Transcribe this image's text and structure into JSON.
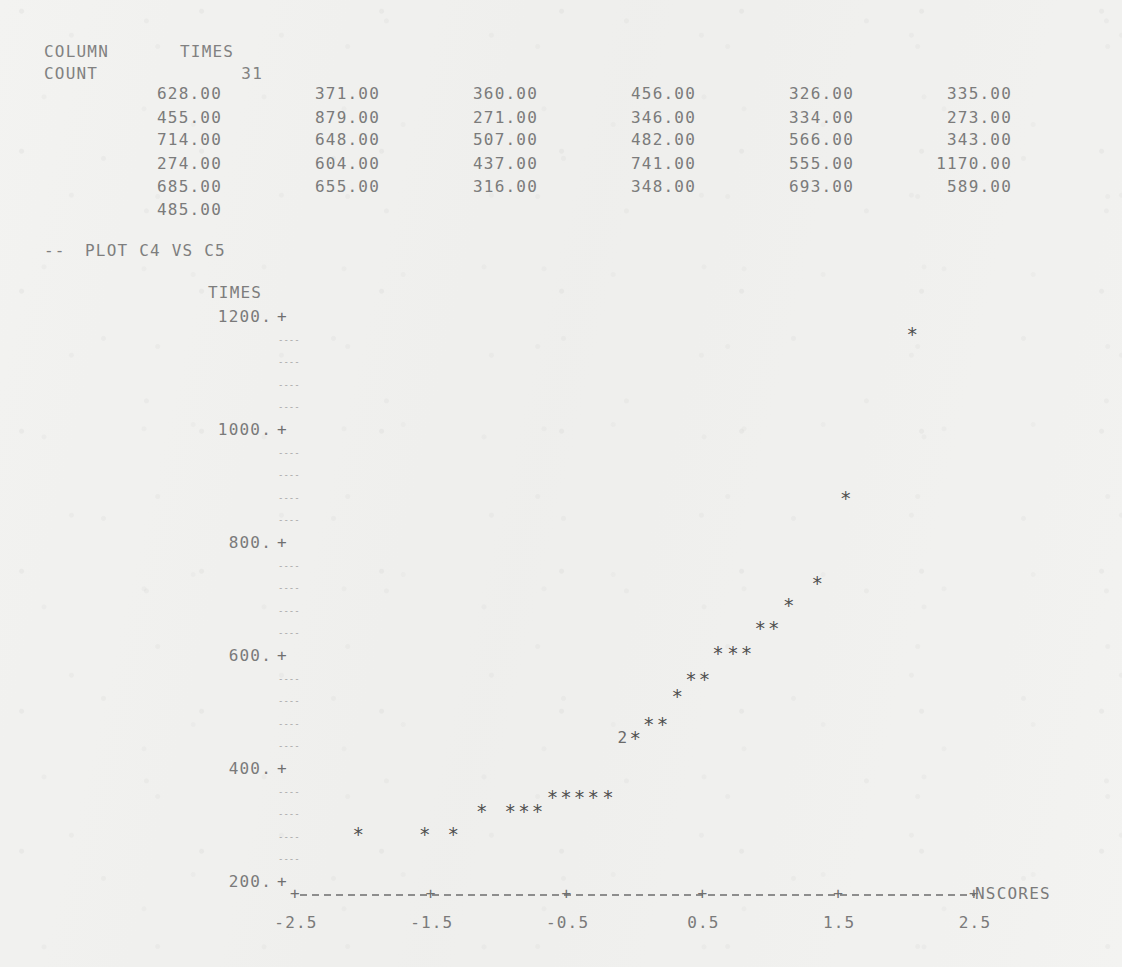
{
  "listing": {
    "column_label": "COLUMN",
    "column_name": "TIMES",
    "count_label": "COUNT",
    "count_value": "31",
    "rows": [
      [
        "628.00",
        "371.00",
        "360.00",
        "456.00",
        "326.00",
        "335.00"
      ],
      [
        "455.00",
        "879.00",
        "271.00",
        "346.00",
        "334.00",
        "273.00"
      ],
      [
        "714.00",
        "648.00",
        "507.00",
        "482.00",
        "566.00",
        "343.00"
      ],
      [
        "274.00",
        "604.00",
        "437.00",
        "741.00",
        "555.00",
        "1170.00"
      ],
      [
        "685.00",
        "655.00",
        "316.00",
        "348.00",
        "693.00",
        "589.00"
      ],
      [
        "485.00",
        "",
        "",
        "",
        "",
        ""
      ]
    ]
  },
  "command": {
    "prompt": "--",
    "text": "PLOT C4 VS C5"
  },
  "plot": {
    "y_axis_title": "TIMES",
    "x_axis_title": "NSCORES",
    "y_ticks": [
      "1200.",
      "1000.",
      "800.",
      "600.",
      "400.",
      "200."
    ],
    "y_tick_values": [
      1200,
      1000,
      800,
      600,
      400,
      200
    ],
    "x_ticks": [
      "-2.5",
      "-1.5",
      "-0.5",
      "0.5",
      "1.5",
      "2.5"
    ],
    "x_tick_values": [
      -2.5,
      -1.5,
      -0.5,
      0.5,
      1.5,
      2.5
    ],
    "tick_glyph": "+",
    "minor_tick_glyph": "----",
    "point_glyph": "*",
    "minor_ticks_between_majors": 4
  },
  "chart_data": {
    "type": "scatter",
    "title": "PLOT C4 VS C5",
    "xlabel": "NSCORES",
    "ylabel": "TIMES",
    "xlim": [
      -2.5,
      2.5
    ],
    "ylim": [
      200,
      1200
    ],
    "grid": false,
    "legend": null,
    "n_points": 31,
    "note": "Normal probability plot. A leading digit before an asterisk denotes that many coincident points at that plotting cell.",
    "points": [
      {
        "x": -2.04,
        "y": 285,
        "glyph": "*",
        "count": 1
      },
      {
        "x": -1.55,
        "y": 285,
        "glyph": "*",
        "count": 1
      },
      {
        "x": -1.34,
        "y": 285,
        "glyph": "*",
        "count": 1
      },
      {
        "x": -1.13,
        "y": 325,
        "glyph": "*",
        "count": 1
      },
      {
        "x": -0.92,
        "y": 325,
        "glyph": "*",
        "count": 1
      },
      {
        "x": -0.82,
        "y": 325,
        "glyph": "*",
        "count": 1
      },
      {
        "x": -0.72,
        "y": 325,
        "glyph": "*",
        "count": 1
      },
      {
        "x": -0.61,
        "y": 350,
        "glyph": "*",
        "count": 1
      },
      {
        "x": -0.51,
        "y": 350,
        "glyph": "*",
        "count": 1
      },
      {
        "x": -0.41,
        "y": 350,
        "glyph": "*",
        "count": 1
      },
      {
        "x": -0.31,
        "y": 350,
        "glyph": "*",
        "count": 1
      },
      {
        "x": -0.2,
        "y": 350,
        "glyph": "*",
        "count": 1
      },
      {
        "x": 0.0,
        "y": 455,
        "glyph": "2*",
        "count": 2
      },
      {
        "x": 0.1,
        "y": 480,
        "glyph": "*",
        "count": 1
      },
      {
        "x": 0.2,
        "y": 480,
        "glyph": "*",
        "count": 1
      },
      {
        "x": 0.31,
        "y": 530,
        "glyph": "*",
        "count": 1
      },
      {
        "x": 0.41,
        "y": 560,
        "glyph": "*",
        "count": 1
      },
      {
        "x": 0.51,
        "y": 560,
        "glyph": "*",
        "count": 1
      },
      {
        "x": 0.61,
        "y": 605,
        "glyph": "*",
        "count": 1
      },
      {
        "x": 0.72,
        "y": 605,
        "glyph": "*",
        "count": 1
      },
      {
        "x": 0.82,
        "y": 605,
        "glyph": "*",
        "count": 1
      },
      {
        "x": 0.92,
        "y": 650,
        "glyph": "*",
        "count": 1
      },
      {
        "x": 1.02,
        "y": 650,
        "glyph": "*",
        "count": 1
      },
      {
        "x": 1.13,
        "y": 690,
        "glyph": "*",
        "count": 1
      },
      {
        "x": 1.34,
        "y": 730,
        "glyph": "*",
        "count": 1
      },
      {
        "x": 1.55,
        "y": 880,
        "glyph": "*",
        "count": 1
      },
      {
        "x": 2.04,
        "y": 1170,
        "glyph": "*",
        "count": 1
      }
    ]
  },
  "colors": {
    "paper": "#f3f3f1",
    "ink": "#7a7a7a",
    "ink_dark": "#4f4f4f"
  }
}
